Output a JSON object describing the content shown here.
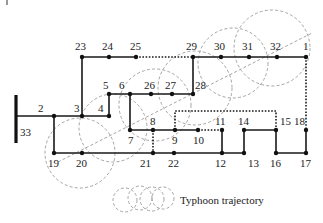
{
  "diagram": {
    "source_bus": {
      "label": "33",
      "x": 16,
      "y1": 95,
      "y2": 143
    },
    "nodes": [
      {
        "id": "1",
        "x": 306,
        "y": 57,
        "lx": 303,
        "ly": 50
      },
      {
        "id": "2",
        "x": 54,
        "y": 116,
        "lx": 38,
        "ly": 112
      },
      {
        "id": "3",
        "x": 82,
        "y": 116,
        "lx": 74,
        "ly": 112
      },
      {
        "id": "4",
        "x": 109,
        "y": 116,
        "lx": 98,
        "ly": 112
      },
      {
        "id": "5",
        "x": 109,
        "y": 94,
        "lx": 103,
        "ly": 89
      },
      {
        "id": "6",
        "x": 130,
        "y": 94,
        "lx": 119,
        "ly": 89
      },
      {
        "id": "7",
        "x": 130,
        "y": 130,
        "lx": 128,
        "ly": 144
      },
      {
        "id": "8",
        "x": 153,
        "y": 130,
        "lx": 150,
        "ly": 125
      },
      {
        "id": "9",
        "x": 175,
        "y": 130,
        "lx": 172,
        "ly": 144
      },
      {
        "id": "10",
        "x": 198,
        "y": 130,
        "lx": 193,
        "ly": 144
      },
      {
        "id": "11",
        "x": 222,
        "y": 130,
        "lx": 215,
        "ly": 125
      },
      {
        "id": "12",
        "x": 222,
        "y": 153,
        "lx": 215,
        "ly": 167
      },
      {
        "id": "13",
        "x": 244,
        "y": 153,
        "lx": 248,
        "ly": 167
      },
      {
        "id": "14",
        "x": 244,
        "y": 130,
        "lx": 238,
        "ly": 125
      },
      {
        "id": "15",
        "x": 276,
        "y": 130,
        "lx": 280,
        "ly": 125
      },
      {
        "id": "16",
        "x": 276,
        "y": 153,
        "lx": 270,
        "ly": 167
      },
      {
        "id": "17",
        "x": 306,
        "y": 153,
        "lx": 300,
        "ly": 167
      },
      {
        "id": "18",
        "x": 306,
        "y": 130,
        "lx": 294,
        "ly": 125
      },
      {
        "id": "19",
        "x": 54,
        "y": 153,
        "lx": 48,
        "ly": 167
      },
      {
        "id": "20",
        "x": 82,
        "y": 153,
        "lx": 76,
        "ly": 167
      },
      {
        "id": "21",
        "x": 153,
        "y": 153,
        "lx": 140,
        "ly": 167
      },
      {
        "id": "22",
        "x": 174,
        "y": 153,
        "lx": 168,
        "ly": 167
      },
      {
        "id": "23",
        "x": 82,
        "y": 57,
        "lx": 75,
        "ly": 50
      },
      {
        "id": "24",
        "x": 109,
        "y": 57,
        "lx": 102,
        "ly": 50
      },
      {
        "id": "25",
        "x": 136,
        "y": 57,
        "lx": 130,
        "ly": 50
      },
      {
        "id": "26",
        "x": 151,
        "y": 94,
        "lx": 144,
        "ly": 89
      },
      {
        "id": "27",
        "x": 172,
        "y": 94,
        "lx": 165,
        "ly": 89
      },
      {
        "id": "28",
        "x": 193,
        "y": 94,
        "lx": 195,
        "ly": 89
      },
      {
        "id": "29",
        "x": 193,
        "y": 57,
        "lx": 186,
        "ly": 50
      },
      {
        "id": "30",
        "x": 221,
        "y": 57,
        "lx": 214,
        "ly": 50
      },
      {
        "id": "31",
        "x": 249,
        "y": 57,
        "lx": 242,
        "ly": 50
      },
      {
        "id": "32",
        "x": 277,
        "y": 57,
        "lx": 270,
        "ly": 50
      }
    ],
    "lines": [
      {
        "points": "16,116 82,116 109,116 109,94 130,94 151,94 172,94 193,94 193,57 221,57 249,57 277,57 306,57"
      },
      {
        "points": "54,116 54,153 82,153 153,153 174,153 222,153 222,130"
      },
      {
        "points": "82,116 82,57 109,57 136,57"
      },
      {
        "points": "130,94 130,130 153,130 175,130 198,130"
      },
      {
        "points": "222,153 244,153 244,130 276,130 276,153 306,153 306,130"
      }
    ],
    "tie_lines": [
      {
        "points": "136,57 193,57"
      },
      {
        "points": "153,130 153,153"
      },
      {
        "points": "198,130 222,130"
      },
      {
        "points": "175,130 175,111 276,111 276,130"
      },
      {
        "points": "306,57 306,130"
      }
    ],
    "typhoon_circles": [
      {
        "cx": 80,
        "cy": 153,
        "r": 35
      },
      {
        "cx": 113,
        "cy": 128,
        "r": 34
      },
      {
        "cx": 155,
        "cy": 105,
        "r": 36
      },
      {
        "cx": 195,
        "cy": 88,
        "r": 37
      },
      {
        "cx": 233,
        "cy": 63,
        "r": 35
      },
      {
        "cx": 272,
        "cy": 48,
        "r": 38
      }
    ],
    "trajectory": {
      "x1": 58,
      "y1": 162,
      "x2": 312,
      "y2": 33
    },
    "legend": {
      "label": "Typhoon trajectory",
      "circles": [
        {
          "cx": 125,
          "cy": 200,
          "r": 12
        },
        {
          "cx": 140,
          "cy": 198,
          "r": 12
        },
        {
          "cx": 152,
          "cy": 199,
          "r": 12
        },
        {
          "cx": 163,
          "cy": 198,
          "r": 11
        }
      ],
      "text_x": 180,
      "text_y": 204
    },
    "colors": {
      "line": "#1a1a1a",
      "typhoon": "#9a9a9a",
      "background": "#ffffff"
    }
  }
}
